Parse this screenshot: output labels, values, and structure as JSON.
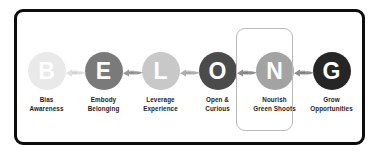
{
  "diagram": {
    "acronym": "BELONG",
    "frame": {
      "border_color": "#0d0d0d",
      "background": "#ffffff"
    },
    "highlight": {
      "name": "nourish-green-shoots-highlight",
      "border_color": "#b9b9b9",
      "target_step_index": 4
    },
    "connector_icon": "hand-pointing-icon",
    "steps": [
      {
        "letter": "B",
        "label": "Bias\nAwareness",
        "circle_color": "#e9e9e9",
        "letter_color": "#ffffff",
        "connector_color": "#dcdcdc"
      },
      {
        "letter": "E",
        "label": "Embody\nBelonging",
        "circle_color": "#7a7a7a",
        "letter_color": "#ffffff",
        "connector_color": "#9a9a9a"
      },
      {
        "letter": "L",
        "label": "Leverage\nExperience",
        "circle_color": "#c8c8c8",
        "letter_color": "#ffffff",
        "connector_color": "#b0b0b0"
      },
      {
        "letter": "O",
        "label": "Open &\nCurious",
        "circle_color": "#4b4b4b",
        "letter_color": "#ffffff",
        "connector_color": "#8d8d8d"
      },
      {
        "letter": "N",
        "label": "Nourish\nGreen Shoots",
        "circle_color": "#a3a3a3",
        "letter_color": "#ffffff",
        "connector_color": "#8d8d8d"
      },
      {
        "letter": "G",
        "label": "Grow\nOpportunities",
        "circle_color": "#262626",
        "letter_color": "#ffffff",
        "connector_color": "#6e6e6e"
      }
    ]
  }
}
